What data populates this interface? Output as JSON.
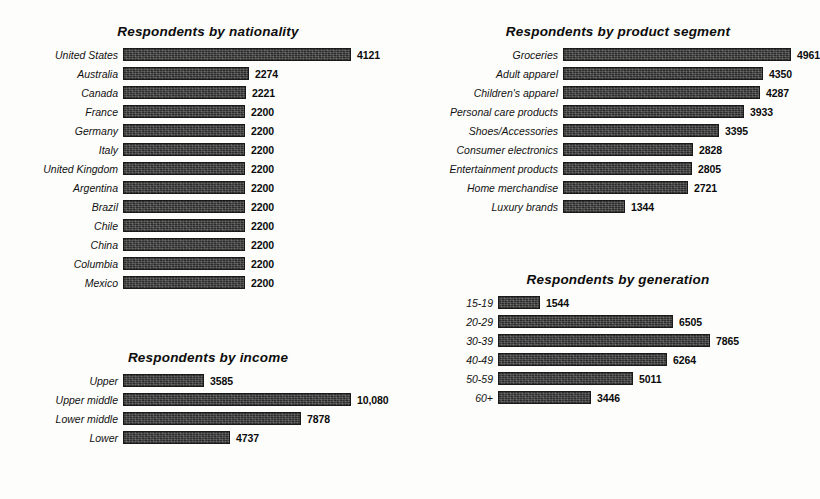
{
  "document": {
    "kind": "scanned-report-figure",
    "panel_count": 4
  },
  "chart_data": [
    {
      "id": "nationality",
      "type": "bar",
      "orientation": "horizontal",
      "title": "Respondents by nationality",
      "xlabel": "",
      "ylabel": "",
      "grid": false,
      "legend": "none",
      "value_labels": true,
      "xlim": [
        0,
        4121
      ],
      "categories": [
        "United States",
        "Australia",
        "Canada",
        "France",
        "Germany",
        "Italy",
        "United Kingdom",
        "Argentina",
        "Brazil",
        "Chile",
        "China",
        "Columbia",
        "Mexico"
      ],
      "values": [
        4121,
        2274,
        2221,
        2200,
        2200,
        2200,
        2200,
        2200,
        2200,
        2200,
        2200,
        2200,
        2200
      ],
      "value_text": [
        "4121",
        "2274",
        "2221",
        "2200",
        "2200",
        "2200",
        "2200",
        "2200",
        "2200",
        "2200",
        "2200",
        "2200",
        "2200"
      ]
    },
    {
      "id": "product-segment",
      "type": "bar",
      "orientation": "horizontal",
      "title": "Respondents by product segment",
      "xlabel": "",
      "ylabel": "",
      "grid": false,
      "legend": "none",
      "value_labels": true,
      "xlim": [
        0,
        4961
      ],
      "categories": [
        "Groceries",
        "Adult apparel",
        "Children's apparel",
        "Personal care products",
        "Shoes/Accessories",
        "Consumer electronics",
        "Entertainment products",
        "Home merchandise",
        "Luxury brands"
      ],
      "values": [
        4961,
        4350,
        4287,
        3933,
        3395,
        2828,
        2805,
        2721,
        1344
      ],
      "value_text": [
        "4961",
        "4350",
        "4287",
        "3933",
        "3395",
        "2828",
        "2805",
        "2721",
        "1344"
      ]
    },
    {
      "id": "income",
      "type": "bar",
      "orientation": "horizontal",
      "title": "Respondents by income",
      "xlabel": "",
      "ylabel": "",
      "grid": false,
      "legend": "none",
      "value_labels": true,
      "xlim": [
        0,
        10080
      ],
      "categories": [
        "Upper",
        "Upper middle",
        "Lower middle",
        "Lower"
      ],
      "values": [
        3585,
        10080,
        7878,
        4737
      ],
      "value_text": [
        "3585",
        "10,080",
        "7878",
        "4737"
      ]
    },
    {
      "id": "generation",
      "type": "bar",
      "orientation": "horizontal",
      "title": "Respondents by generation",
      "xlabel": "",
      "ylabel": "",
      "grid": false,
      "legend": "none",
      "value_labels": true,
      "xlim": [
        0,
        7865
      ],
      "categories": [
        "15-19",
        "20-29",
        "30-39",
        "40-49",
        "50-59",
        "60+"
      ],
      "values": [
        1544,
        6505,
        7865,
        6264,
        5011,
        3446
      ],
      "value_text": [
        "1544",
        "6505",
        "7865",
        "6264",
        "5011",
        "3446"
      ]
    }
  ],
  "style": {
    "bar_color": "#2b2b2b",
    "background": "#fdfdfb",
    "text_color": "#111111"
  }
}
